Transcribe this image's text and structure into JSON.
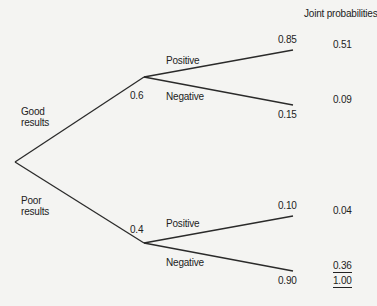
{
  "header": {
    "joint_title": "Joint probabilities"
  },
  "first_stage": {
    "good": {
      "label": "Good\nresults",
      "prob": "0.6"
    },
    "poor": {
      "label": "Poor\nresults",
      "prob": "0.4"
    }
  },
  "second_stage": {
    "good_positive": {
      "label": "Positive",
      "prob": "0.85",
      "joint": "0.51"
    },
    "good_negative": {
      "label": "Negative",
      "prob": "0.15",
      "joint": "0.09"
    },
    "poor_positive": {
      "label": "Positive",
      "prob": "0.10",
      "joint": "0.04"
    },
    "poor_negative": {
      "label": "Negative",
      "prob": "0.90",
      "joint": "0.36"
    }
  },
  "total": "1.00",
  "colors": {
    "line": "#2a2a2a",
    "text": "#222222",
    "background": "#f4f4f2"
  }
}
